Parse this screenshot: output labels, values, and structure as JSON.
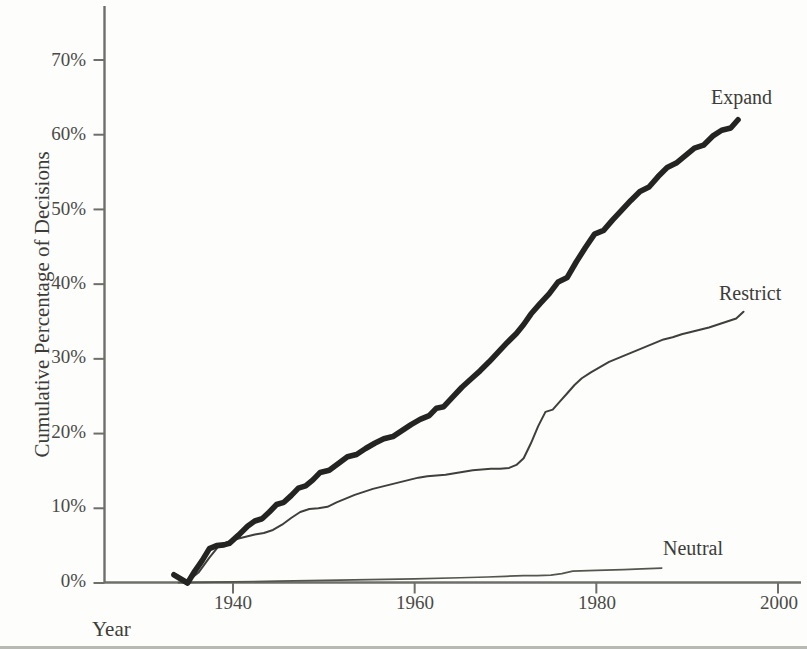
{
  "chart_data": {
    "type": "line",
    "title": "",
    "xlabel": "Year",
    "ylabel": "Cumulative Percentage of Decisions",
    "xlim": [
      1930,
      2002
    ],
    "ylim": [
      0,
      75
    ],
    "grid": false,
    "legend_position": "inline-right-of-line-ends",
    "x_ticks": [
      "1940",
      "1960",
      "1980",
      "2000"
    ],
    "x_tick_values": [
      1940,
      1960,
      1980,
      2000
    ],
    "y_ticks": [
      "0%",
      "10%",
      "20%",
      "30%",
      "40%",
      "50%",
      "60%",
      "70%"
    ],
    "y_tick_values": [
      0,
      10,
      20,
      30,
      40,
      50,
      60,
      70
    ],
    "series": [
      {
        "name": "Expand",
        "style": "thick-black",
        "color": "#2b2b29",
        "x": [
          1933.5,
          1935.0,
          1935.8,
          1936.6,
          1937.4,
          1938.2,
          1939.0,
          1939.6,
          1940.6,
          1941.6,
          1942.4,
          1943.2,
          1944.0,
          1944.8,
          1945.6,
          1946.4,
          1947.2,
          1948.0,
          1948.8,
          1949.6,
          1950.6,
          1951.6,
          1952.6,
          1953.6,
          1954.6,
          1955.6,
          1956.6,
          1957.6,
          1958.6,
          1959.6,
          1960.6,
          1961.6,
          1962.4,
          1963.2,
          1964.2,
          1965.2,
          1966.2,
          1967.2,
          1968.2,
          1969.2,
          1970.2,
          1971.2,
          1972.0,
          1972.8,
          1973.8,
          1974.8,
          1975.8,
          1976.8,
          1977.8,
          1978.8,
          1979.8,
          1980.8,
          1981.8,
          1982.8,
          1983.8,
          1984.8,
          1985.8,
          1986.8,
          1987.8,
          1988.8,
          1989.8,
          1990.8,
          1991.8,
          1992.8,
          1993.8,
          1994.8,
          1995.6
        ],
        "y": [
          1.1,
          0.0,
          1.6,
          3.0,
          4.6,
          5.0,
          5.1,
          5.3,
          6.4,
          7.6,
          8.3,
          8.6,
          9.5,
          10.5,
          10.8,
          11.7,
          12.7,
          13.0,
          13.8,
          14.8,
          15.1,
          16.0,
          16.9,
          17.2,
          18.0,
          18.7,
          19.3,
          19.6,
          20.4,
          21.2,
          21.9,
          22.4,
          23.4,
          23.6,
          24.9,
          26.2,
          27.3,
          28.4,
          29.6,
          30.9,
          32.2,
          33.4,
          34.6,
          36.0,
          37.4,
          38.7,
          40.3,
          40.9,
          43.0,
          44.9,
          46.7,
          47.2,
          48.6,
          49.9,
          51.2,
          52.4,
          53.0,
          54.4,
          55.6,
          56.2,
          57.2,
          58.2,
          58.6,
          59.8,
          60.6,
          60.9,
          62.0
        ]
      },
      {
        "name": "Restrict",
        "style": "thin-black",
        "color": "#3a3a38",
        "x": [
          1933.5,
          1935.0,
          1936.2,
          1937.4,
          1938.4,
          1939.4,
          1940.4,
          1941.4,
          1942.4,
          1943.4,
          1944.4,
          1945.4,
          1946.4,
          1947.4,
          1948.4,
          1949.4,
          1950.4,
          1951.4,
          1952.4,
          1953.4,
          1954.4,
          1955.4,
          1956.4,
          1957.4,
          1958.4,
          1959.4,
          1960.4,
          1961.4,
          1962.4,
          1963.4,
          1964.4,
          1965.4,
          1966.4,
          1967.4,
          1968.4,
          1969.4,
          1970.4,
          1971.2,
          1972.0,
          1972.8,
          1973.6,
          1974.4,
          1975.2,
          1976.0,
          1976.8,
          1977.6,
          1978.4,
          1979.4,
          1980.4,
          1981.4,
          1982.4,
          1983.4,
          1984.4,
          1985.4,
          1986.4,
          1987.4,
          1988.4,
          1989.4,
          1990.4,
          1991.4,
          1992.4,
          1993.4,
          1994.4,
          1995.4,
          1996.2
        ],
        "y": [
          1.3,
          0.2,
          1.4,
          3.4,
          4.9,
          5.5,
          5.9,
          6.2,
          6.5,
          6.7,
          7.1,
          7.8,
          8.7,
          9.5,
          9.9,
          10.0,
          10.2,
          10.8,
          11.3,
          11.8,
          12.2,
          12.6,
          12.9,
          13.2,
          13.5,
          13.8,
          14.1,
          14.3,
          14.4,
          14.5,
          14.7,
          14.9,
          15.1,
          15.2,
          15.3,
          15.3,
          15.4,
          15.8,
          16.7,
          18.7,
          21.0,
          22.9,
          23.2,
          24.3,
          25.4,
          26.5,
          27.4,
          28.2,
          28.9,
          29.6,
          30.1,
          30.6,
          31.1,
          31.6,
          32.1,
          32.6,
          32.9,
          33.3,
          33.6,
          33.9,
          34.2,
          34.6,
          35.0,
          35.4,
          36.3
        ]
      },
      {
        "name": "Neutral",
        "style": "thin-black",
        "color": "#4a4a47",
        "x": [
          1934.0,
          1940.0,
          1945.0,
          1950.0,
          1955.0,
          1960.0,
          1965.0,
          1968.0,
          1970.0,
          1972.0,
          1973.5,
          1975.0,
          1976.2,
          1977.4,
          1980.0,
          1983.0,
          1985.0,
          1987.2
        ],
        "y": [
          0.05,
          0.15,
          0.25,
          0.35,
          0.45,
          0.55,
          0.7,
          0.8,
          0.9,
          1.0,
          1.0,
          1.05,
          1.25,
          1.6,
          1.7,
          1.8,
          1.9,
          2.0
        ]
      }
    ],
    "annotations": [
      {
        "text": "Expand",
        "x_px": 713,
        "y_px": 92
      },
      {
        "text": "Restrict",
        "x_px": 721,
        "y_px": 288
      },
      {
        "text": "Neutral",
        "x_px": 665,
        "y_px": 543
      }
    ]
  },
  "axes": {
    "y_label": "Cumulative Percentage of Decisions",
    "x_label": "Year",
    "y_tick_labels": [
      "70%",
      "60%",
      "50%",
      "40%",
      "30%",
      "20%",
      "10%",
      "0%"
    ],
    "x_tick_labels": [
      "1940",
      "1960",
      "1980",
      "2000"
    ]
  },
  "legend": {
    "expand": "Expand",
    "restrict": "Restrict",
    "neutral": "Neutral"
  }
}
